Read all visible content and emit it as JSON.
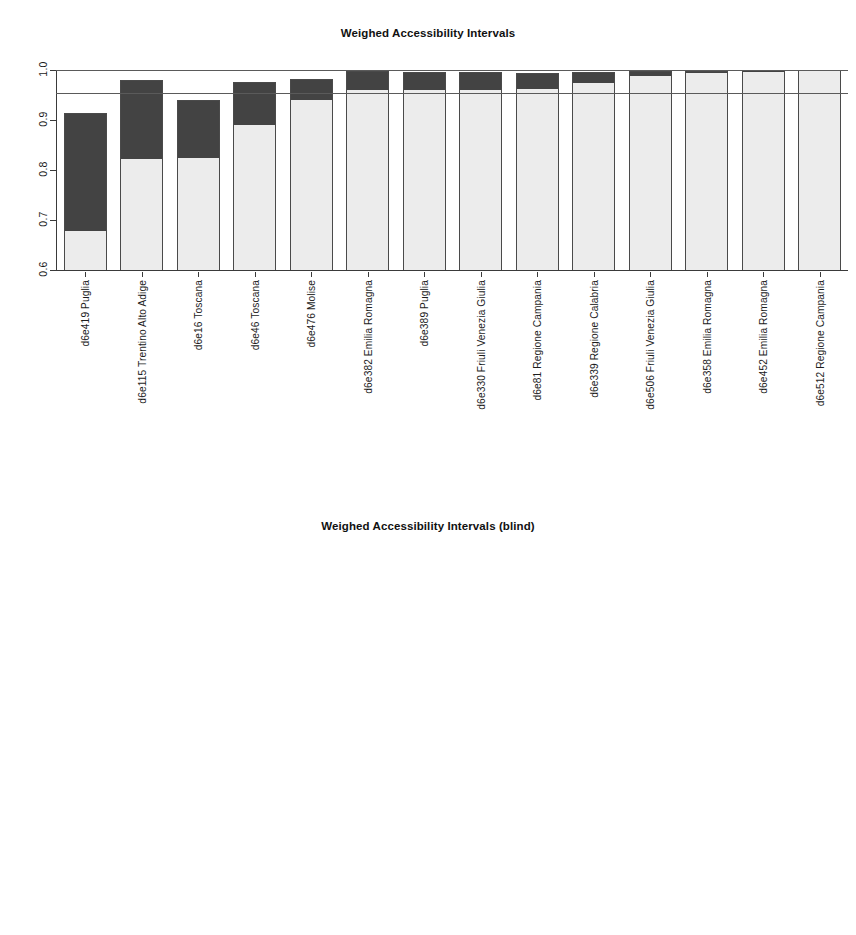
{
  "page": {
    "background": "#ffffff",
    "bar_fill_light": "#ececec",
    "bar_fill_dark": "#434343",
    "axis_color": "#3a3a3a"
  },
  "chart_data": [
    {
      "id": "weighed-accessibility-intervals",
      "type": "bar",
      "title": "Weighed Accessibility Intervals",
      "xlabel": "",
      "ylabel": "",
      "ylim": [
        0.6,
        1.0
      ],
      "yticks": [
        "1.0",
        "0.9",
        "0.8",
        "0.7",
        "0.6"
      ],
      "ytick_values": [
        1.0,
        0.9,
        0.8,
        0.7,
        0.6
      ],
      "grid": false,
      "legend": "none",
      "reference_lines": [
        1.0,
        0.955
      ],
      "categories": [
        "d6e419 Puglia",
        "d6e115 Trentino Alto Adige",
        "d6e16 Toscana",
        "d6e46 Toscana",
        "d6e476 Molise",
        "d6e382 Emilia Romagna",
        "d6e389 Puglia",
        "d6e330 Friuli Venezia Giulia",
        "d6e81 Regione Campania",
        "d6e339 Regione Calabria",
        "d6e506 Friuli Venezia Giulia",
        "d6e358 Emilia Romagna",
        "d6e452 Emilia Romagna",
        "d6e512 Regione Campania"
      ],
      "series": [
        {
          "name": "lower bound (light segment top)",
          "values": [
            0.68,
            0.825,
            0.827,
            0.893,
            0.943,
            0.962,
            0.962,
            0.963,
            0.964,
            0.976,
            0.99,
            0.996,
            0.998,
            1.0
          ]
        },
        {
          "name": "upper bound (bar top)",
          "values": [
            0.915,
            0.98,
            0.941,
            0.977,
            0.983,
            0.999,
            0.996,
            0.996,
            0.995,
            0.996,
            0.999,
            0.999,
            1.0,
            1.0
          ]
        }
      ]
    },
    {
      "id": "weighed-accessibility-intervals-blind",
      "type": "bar",
      "title": "Weighed Accessibility Intervals (blind)",
      "xlabel": "",
      "ylabel": "",
      "ylim": [
        0.8,
        1.0
      ],
      "yticks": [
        "1.00",
        "0.95",
        "0.90",
        "0.85",
        "0.80"
      ],
      "ytick_values": [
        1.0,
        0.95,
        0.9,
        0.85,
        0.8
      ],
      "grid": false,
      "legend": "none",
      "reference_lines": [
        1.0,
        0.9935
      ],
      "categories": [
        "d6e419 Puglia",
        "d6e476 Molise",
        "d6e389 Puglia",
        "d6e115 Trentino Alto Adige",
        "d6e16 Toscana",
        "d6e506 Friuli Venezia Giulia",
        "d6e382 Emilia Romagna",
        "d6e46 Toscana",
        "d6e339 Regione Calabria",
        "d6e358 Emilia Romagna",
        "d6e330 Friuli Venezia Giulia",
        "d6e452 Emilia Romagna",
        "d6e512 Regione Campania",
        "d6e81 Regione Campania"
      ],
      "series": [
        {
          "name": "lower bound (light segment top)",
          "values": [
            0.9355,
            0.942,
            0.961,
            0.9865,
            0.988,
            0.9885,
            0.992,
            0.993,
            0.993,
            0.994,
            0.9955,
            0.9975,
            0.999,
            1.0
          ]
        },
        {
          "name": "upper bound (bar top)",
          "values": [
            0.9815,
            0.9845,
            0.9935,
            0.9985,
            0.993,
            0.9985,
            0.9985,
            0.9975,
            0.9985,
            0.9985,
            0.9985,
            0.9985,
            0.9995,
            1.0
          ]
        }
      ]
    }
  ]
}
